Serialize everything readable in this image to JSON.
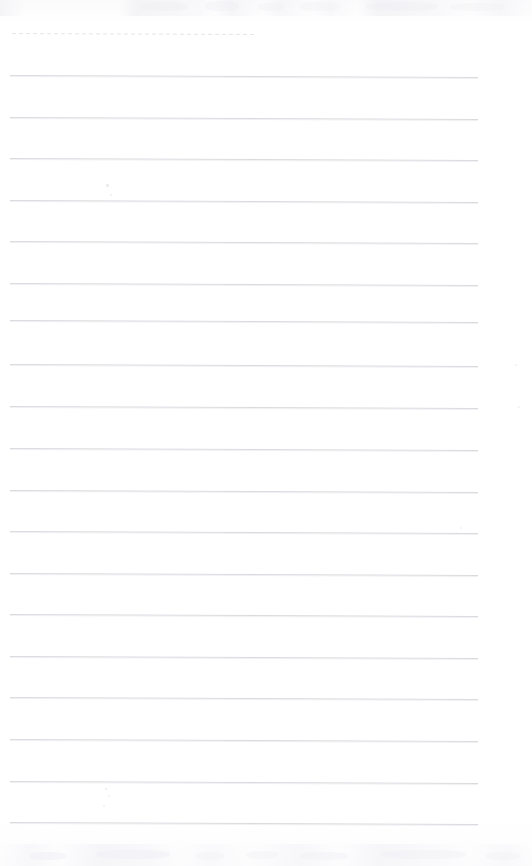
{
  "document": {
    "kind": "scanned-blank-ruled-page",
    "title": "Scanned Ruled Page",
    "page_width": 532,
    "page_height": 866,
    "background_color": "#fefeff",
    "has_text_content": false,
    "visible_text": ""
  },
  "paper": {
    "rule_color": "#d9d9de",
    "rule_color_faint": "#e2e2e8",
    "rule_left_x": 10,
    "rule_right_x": 478,
    "rule_width": 468,
    "rule_thickness": 1,
    "rule_spacing": 41.7,
    "first_rule_y": 75,
    "rule_slope_px": 2,
    "rule_count": 19
  },
  "rules": [
    {
      "id": "rule-1",
      "y": 75,
      "x": 10,
      "width": 468,
      "style": "solid"
    },
    {
      "id": "rule-2",
      "y": 117,
      "x": 10,
      "width": 468,
      "style": "solid"
    },
    {
      "id": "rule-3",
      "y": 158,
      "x": 10,
      "width": 468,
      "style": "solid"
    },
    {
      "id": "rule-4",
      "y": 200,
      "x": 10,
      "width": 468,
      "style": "solid"
    },
    {
      "id": "rule-5",
      "y": 241,
      "x": 10,
      "width": 468,
      "style": "solid"
    },
    {
      "id": "rule-6",
      "y": 283,
      "x": 10,
      "width": 468,
      "style": "solid"
    },
    {
      "id": "rule-7",
      "y": 320,
      "x": 10,
      "width": 468,
      "style": "solid"
    },
    {
      "id": "rule-8",
      "y": 364,
      "x": 10,
      "width": 468,
      "style": "solid"
    },
    {
      "id": "rule-9",
      "y": 406,
      "x": 10,
      "width": 468,
      "style": "solid"
    },
    {
      "id": "rule-10",
      "y": 448,
      "x": 10,
      "width": 468,
      "style": "solid"
    },
    {
      "id": "rule-11",
      "y": 490,
      "x": 10,
      "width": 468,
      "style": "solid"
    },
    {
      "id": "rule-12",
      "y": 531,
      "x": 10,
      "width": 468,
      "style": "solid"
    },
    {
      "id": "rule-13",
      "y": 573,
      "x": 10,
      "width": 468,
      "style": "solid"
    },
    {
      "id": "rule-14",
      "y": 614,
      "x": 10,
      "width": 468,
      "style": "solid"
    },
    {
      "id": "rule-15",
      "y": 656,
      "x": 10,
      "width": 468,
      "style": "solid"
    },
    {
      "id": "rule-16",
      "y": 697,
      "x": 10,
      "width": 468,
      "style": "solid"
    },
    {
      "id": "rule-17",
      "y": 739,
      "x": 10,
      "width": 468,
      "style": "solid"
    },
    {
      "id": "rule-18",
      "y": 781,
      "x": 10,
      "width": 468,
      "style": "solid"
    },
    {
      "id": "rule-19",
      "y": 822,
      "x": 10,
      "width": 468,
      "style": "solid"
    }
  ],
  "partial_rule": {
    "id": "rule-dashed-top",
    "y": 33,
    "x": 12,
    "width": 243,
    "style": "dashed",
    "color": "#e2e2e8"
  },
  "marks": [
    {
      "id": "speck-a",
      "x": 106,
      "y": 184,
      "size": 2.5,
      "opacity": 0.8
    },
    {
      "id": "speck-b",
      "x": 110,
      "y": 194,
      "size": 2.0,
      "opacity": 0.6
    },
    {
      "id": "speck-c",
      "x": 114,
      "y": 200,
      "size": 1.6,
      "opacity": 0.5
    },
    {
      "id": "speck-d",
      "x": 460,
      "y": 527,
      "size": 2.2,
      "opacity": 0.6
    },
    {
      "id": "speck-e",
      "x": 515,
      "y": 364,
      "size": 2.4,
      "opacity": 0.55
    },
    {
      "id": "speck-f",
      "x": 518,
      "y": 406,
      "size": 2.2,
      "opacity": 0.5
    },
    {
      "id": "speck-g",
      "x": 105,
      "y": 788,
      "size": 2.4,
      "opacity": 0.7
    },
    {
      "id": "speck-h",
      "x": 108,
      "y": 795,
      "size": 2.0,
      "opacity": 0.6
    },
    {
      "id": "speck-i",
      "x": 103,
      "y": 805,
      "size": 2.2,
      "opacity": 0.6
    }
  ],
  "smudges": [
    {
      "id": "smudge-top-1",
      "x": 140,
      "y": 2,
      "w": 48,
      "h": 9,
      "opacity": 0.55
    },
    {
      "id": "smudge-top-2",
      "x": 205,
      "y": 1,
      "w": 34,
      "h": 10,
      "opacity": 0.45
    },
    {
      "id": "smudge-top-3",
      "x": 258,
      "y": 3,
      "w": 26,
      "h": 8,
      "opacity": 0.4
    },
    {
      "id": "smudge-top-4",
      "x": 300,
      "y": 2,
      "w": 40,
      "h": 9,
      "opacity": 0.4
    },
    {
      "id": "smudge-top-5",
      "x": 366,
      "y": 2,
      "w": 72,
      "h": 9,
      "opacity": 0.45
    },
    {
      "id": "smudge-top-6",
      "x": 450,
      "y": 3,
      "w": 54,
      "h": 8,
      "opacity": 0.4
    },
    {
      "id": "smudge-bottom-1",
      "x": 30,
      "y": 852,
      "w": 36,
      "h": 8,
      "opacity": 0.5
    },
    {
      "id": "smudge-bottom-2",
      "x": 96,
      "y": 850,
      "w": 74,
      "h": 9,
      "opacity": 0.5
    },
    {
      "id": "smudge-bottom-3",
      "x": 196,
      "y": 852,
      "w": 28,
      "h": 8,
      "opacity": 0.4
    },
    {
      "id": "smudge-bottom-4",
      "x": 246,
      "y": 851,
      "w": 32,
      "h": 8,
      "opacity": 0.4
    },
    {
      "id": "smudge-bottom-5",
      "x": 300,
      "y": 852,
      "w": 48,
      "h": 8,
      "opacity": 0.45
    },
    {
      "id": "smudge-bottom-6",
      "x": 380,
      "y": 850,
      "w": 86,
      "h": 9,
      "opacity": 0.45
    },
    {
      "id": "smudge-bottom-7",
      "x": 486,
      "y": 852,
      "w": 34,
      "h": 8,
      "opacity": 0.4
    }
  ]
}
